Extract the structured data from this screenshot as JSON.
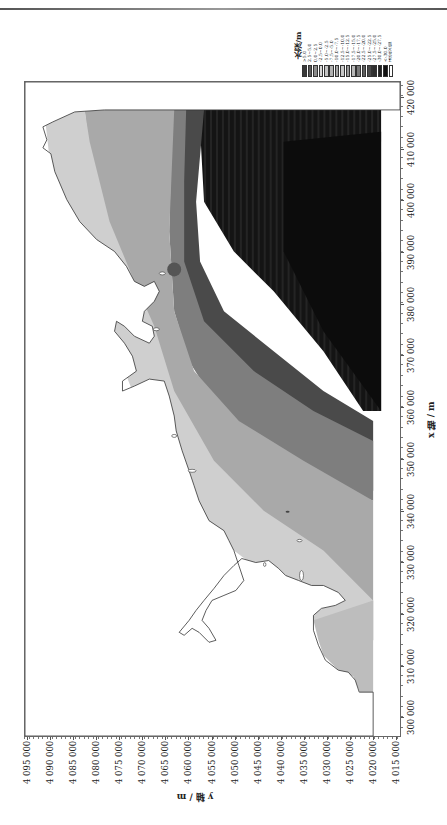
{
  "figure": {
    "orientation_note": "figure printed rotated 90°; x-axis runs along right edge, y-axis along bottom"
  },
  "legend": {
    "title": "水深/m",
    "items": [
      {
        "label": ">5.0",
        "color": "#3a3a3a"
      },
      {
        "label": "2.5~5.0",
        "color": "#5a5a5a"
      },
      {
        "label": "0.0~2.5",
        "color": "#8c8c8c"
      },
      {
        "label": "-2.5~0.0",
        "color": "#d6d6d6"
      },
      {
        "label": "-5.0~-2.5",
        "color": "#c4c4c4"
      },
      {
        "label": "-7.5~-5.0",
        "color": "#b2b2b2"
      },
      {
        "label": "-10.0~-7.5",
        "color": "#a8a8a8"
      },
      {
        "label": "-12.5~-10.0",
        "color": "#c8c8c8"
      },
      {
        "label": "-15.0~-12.5",
        "color": "#9a9a9a"
      },
      {
        "label": "-17.5~-15.0",
        "color": "#b8b8b8"
      },
      {
        "label": "-20.0~-17.5",
        "color": "#7a7a7a"
      },
      {
        "label": "-22.5~-20.0",
        "color": "#5e5e5e"
      },
      {
        "label": "-25.0~-22.5",
        "color": "#4a4a4a"
      },
      {
        "label": "-27.5~-25.0",
        "color": "#2e2e2e"
      },
      {
        "label": "-30.0~-27.5",
        "color": "#202020"
      },
      {
        "label": "<-30.0",
        "color": "#111111"
      },
      {
        "label": "未定义值",
        "color": "#ffffff"
      }
    ]
  },
  "axes": {
    "x_title": "x 轴 / m",
    "y_title": "y 轴 / m",
    "x_ticks": [
      "290 000",
      "300 000",
      "310 000",
      "320 000",
      "330 000",
      "340 000",
      "350 000",
      "360 000",
      "370 000",
      "380 000",
      "390 000",
      "400 000",
      "410 000",
      "420 000"
    ],
    "y_ticks": [
      "4 095 000",
      "4 090 000",
      "4 085 000",
      "4 080 000",
      "4 075 000",
      "4 070 000",
      "4 065 000",
      "4 060 000",
      "4 055 000",
      "4 050 000",
      "4 045 000",
      "4 040 000",
      "4 035 000",
      "4 030 000",
      "4 025 000",
      "4 020 000",
      "4 015 000"
    ]
  },
  "chart_data": {
    "type": "heatmap",
    "title": "",
    "xlabel": "x 轴 / m",
    "ylabel": "y 轴 / m",
    "xlim": [
      285000,
      420000
    ],
    "ylim": [
      4015000,
      4096000
    ],
    "legend_title": "水深/m",
    "legend_classes": [
      ">5.0",
      "2.5~5.0",
      "0.0~2.5",
      "-2.5~0.0",
      "-5.0~-2.5",
      "-7.5~-5.0",
      "-10.0~-7.5",
      "-12.5~-10.0",
      "-15.0~-12.5",
      "-17.5~-15.0",
      "-20.0~-17.5",
      "-22.5~-20.0",
      "-25.0~-22.5",
      "-27.5~-25.0",
      "-30.0~-27.5",
      "<-30.0",
      "未定义值"
    ],
    "grid": false,
    "legend_position": "top-right"
  }
}
